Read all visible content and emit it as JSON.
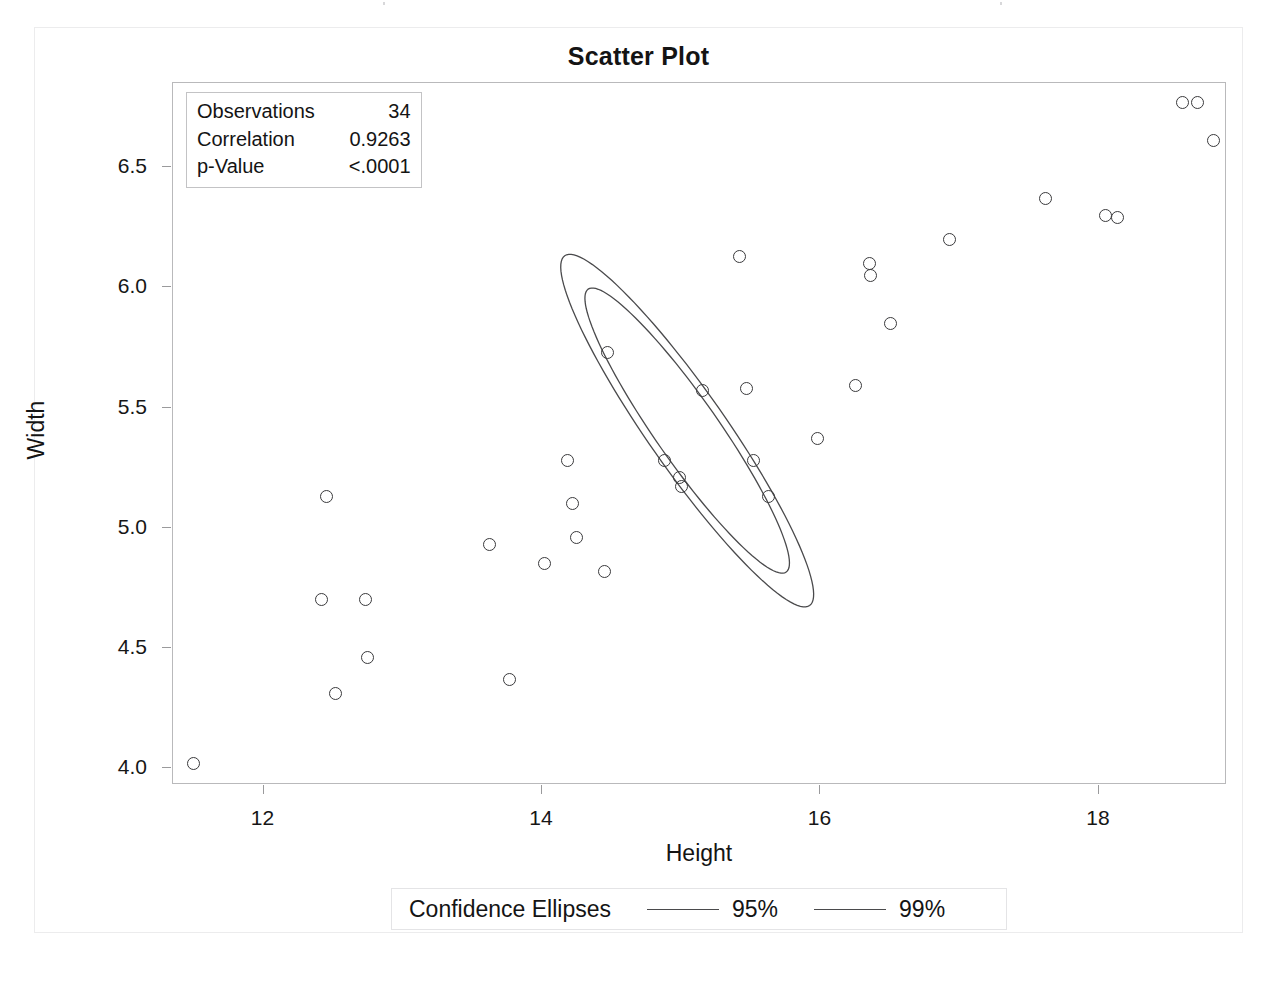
{
  "chart_data": {
    "type": "scatter",
    "title": "Scatter Plot",
    "xlabel": "Height",
    "ylabel": "Width",
    "xlim": [
      11.35,
      18.92
    ],
    "ylim": [
      3.93,
      6.85
    ],
    "xticks": [
      12,
      14,
      16,
      18
    ],
    "xtick_labels": [
      "12",
      "14",
      "16",
      "18"
    ],
    "yticks": [
      4.0,
      4.5,
      5.0,
      5.5,
      6.0,
      6.5
    ],
    "ytick_labels": [
      "4.0",
      "4.5",
      "5.0",
      "5.5",
      "6.0",
      "6.5"
    ],
    "grid": false,
    "legend_position": "bottom",
    "marker": "open-circle",
    "points": [
      {
        "x": 11.5,
        "y": 4.02
      },
      {
        "x": 12.45,
        "y": 5.13
      },
      {
        "x": 12.42,
        "y": 4.7
      },
      {
        "x": 12.52,
        "y": 4.31
      },
      {
        "x": 12.73,
        "y": 4.7
      },
      {
        "x": 12.75,
        "y": 4.46
      },
      {
        "x": 13.62,
        "y": 4.93
      },
      {
        "x": 13.77,
        "y": 4.37
      },
      {
        "x": 14.02,
        "y": 4.85
      },
      {
        "x": 14.18,
        "y": 5.28
      },
      {
        "x": 14.25,
        "y": 4.96
      },
      {
        "x": 14.22,
        "y": 5.1
      },
      {
        "x": 14.45,
        "y": 4.82
      },
      {
        "x": 14.47,
        "y": 5.73
      },
      {
        "x": 14.88,
        "y": 5.28
      },
      {
        "x": 14.99,
        "y": 5.21
      },
      {
        "x": 15.0,
        "y": 5.17
      },
      {
        "x": 15.15,
        "y": 5.57
      },
      {
        "x": 15.42,
        "y": 6.13
      },
      {
        "x": 15.47,
        "y": 5.58
      },
      {
        "x": 15.52,
        "y": 5.28
      },
      {
        "x": 15.63,
        "y": 5.13
      },
      {
        "x": 15.98,
        "y": 5.37
      },
      {
        "x": 16.25,
        "y": 5.59
      },
      {
        "x": 16.35,
        "y": 6.1
      },
      {
        "x": 16.36,
        "y": 6.05
      },
      {
        "x": 16.5,
        "y": 5.85
      },
      {
        "x": 16.93,
        "y": 6.2
      },
      {
        "x": 17.62,
        "y": 6.37
      },
      {
        "x": 18.05,
        "y": 6.3
      },
      {
        "x": 18.13,
        "y": 6.29
      },
      {
        "x": 18.6,
        "y": 6.77
      },
      {
        "x": 18.71,
        "y": 6.77
      },
      {
        "x": 18.82,
        "y": 6.61
      }
    ],
    "ellipses": [
      {
        "name": "95%",
        "cx": 15.05,
        "cy": 5.4,
        "rx": 0.93,
        "ry": 0.175,
        "angle_deg": -38.5
      },
      {
        "name": "99%",
        "cx": 15.05,
        "cy": 5.4,
        "rx": 1.15,
        "ry": 0.216,
        "angle_deg": -38.5
      }
    ]
  },
  "stats_box": {
    "rows": [
      {
        "label": "Observations",
        "value": "34"
      },
      {
        "label": "Correlation",
        "value": "0.9263"
      },
      {
        "label": "p-Value",
        "value": "<.0001"
      }
    ]
  },
  "legend": {
    "title": "Confidence Ellipses",
    "entries": [
      {
        "label": "95%"
      },
      {
        "label": "99%"
      }
    ]
  },
  "colors": {
    "marker_stroke": "#3a3a3c",
    "ellipse_stroke": "#4a4a4c",
    "axis": "#9a9a9c",
    "wall_border": "#b9b9bb",
    "text": "#141414"
  }
}
